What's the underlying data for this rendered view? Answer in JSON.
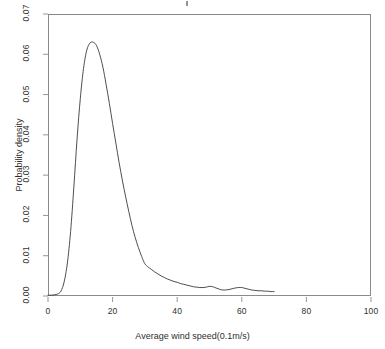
{
  "chart_data": {
    "type": "line",
    "title": "",
    "subtitle": "",
    "xlabel": "Average wind speed(0.1m/s)",
    "ylabel": "Probability density",
    "xlim": [
      0,
      100
    ],
    "ylim": [
      0,
      0.07
    ],
    "xticks": [
      0,
      20,
      40,
      60,
      80,
      100
    ],
    "xtick_labels": [
      "0",
      "20",
      "40",
      "60",
      "80",
      "100"
    ],
    "yticks": [
      0.0,
      0.01,
      0.02,
      0.03,
      0.04,
      0.05,
      0.06,
      0.07
    ],
    "ytick_labels": [
      "0.00",
      "0.01",
      "0.02",
      "0.03",
      "0.04",
      "0.05",
      "0.06",
      "0.07"
    ],
    "grid": false,
    "legend": null,
    "legend_position": "none",
    "line_color": "#3a3a3a",
    "frame_color": "#8a8a8a",
    "background": "#ffffff",
    "series": [
      {
        "name": "Wind speed probability density",
        "x": [
          0,
          1,
          2,
          3,
          4,
          5,
          6,
          7,
          8,
          9,
          10,
          11,
          12,
          13,
          14,
          15,
          16,
          17,
          18,
          19,
          20,
          21,
          22,
          23,
          24,
          25,
          26,
          27,
          28,
          29,
          30,
          31,
          32,
          33,
          34,
          35,
          36,
          37,
          38,
          39,
          40,
          41,
          42,
          43,
          44,
          45,
          46,
          47,
          48,
          49,
          50,
          51,
          52,
          53,
          54,
          55,
          56,
          57,
          58,
          59,
          60,
          61,
          62,
          63,
          64,
          65,
          66,
          67,
          68,
          69,
          70
        ],
        "values": [
          0.0002,
          0.0002,
          0.0003,
          0.0005,
          0.0012,
          0.0035,
          0.0082,
          0.016,
          0.027,
          0.039,
          0.049,
          0.0565,
          0.061,
          0.0628,
          0.063,
          0.0622,
          0.06,
          0.0568,
          0.0525,
          0.0478,
          0.0428,
          0.038,
          0.0332,
          0.0288,
          0.0248,
          0.021,
          0.0175,
          0.0145,
          0.012,
          0.0098,
          0.008,
          0.0072,
          0.0066,
          0.006,
          0.0055,
          0.005,
          0.0046,
          0.0042,
          0.0039,
          0.0036,
          0.0034,
          0.0031,
          0.0029,
          0.0027,
          0.0025,
          0.0023,
          0.0022,
          0.0021,
          0.0021,
          0.0022,
          0.0024,
          0.0023,
          0.002,
          0.0017,
          0.0015,
          0.0015,
          0.0016,
          0.0018,
          0.002,
          0.0021,
          0.0021,
          0.0019,
          0.0017,
          0.0015,
          0.0014,
          0.0013,
          0.0013,
          0.0012,
          0.0012,
          0.0011,
          0.0011
        ]
      }
    ]
  },
  "axes": {
    "x_title": "Average wind speed(0.1m/s)",
    "y_title": "Probability density"
  }
}
